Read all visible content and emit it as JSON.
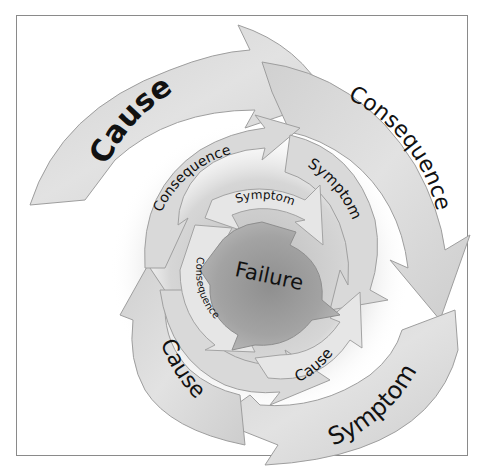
{
  "diagram": {
    "center": {
      "label": "Failure"
    },
    "rings": [
      {
        "name": "inner",
        "labels": [
          "Symptom",
          "Consequence",
          "Cause"
        ]
      },
      {
        "name": "middle",
        "labels": [
          "Consequence",
          "Symptom"
        ]
      },
      {
        "name": "outer",
        "labels": [
          "Cause",
          "Consequence",
          "Symptom",
          "Cause"
        ]
      }
    ],
    "colors": {
      "center": "#9a9a9a",
      "inner_band": "#c9c9c9",
      "middle_band": "#d8d8d8",
      "outer_band": "#d4d4d4",
      "band_stroke": "#9e9e9e",
      "frame": "#8a8a8a",
      "text": "#111111"
    }
  }
}
